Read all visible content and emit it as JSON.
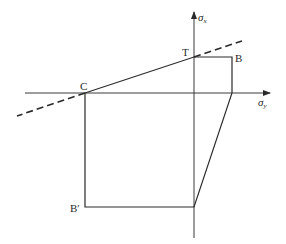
{
  "diagram": {
    "axes": {
      "horizontal_label": "σ",
      "horizontal_sub": "y",
      "vertical_label": "σ",
      "vertical_sub": "x"
    },
    "points": {
      "C": "C",
      "T": "T",
      "B": "B",
      "B_prime": "B′"
    },
    "colors": {
      "line": "#2a2a2a",
      "background": "#ffffff"
    }
  }
}
